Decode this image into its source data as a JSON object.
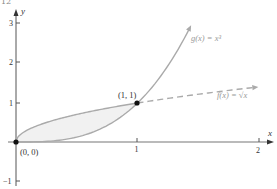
{
  "page_number": "12",
  "chart_data": {
    "type": "line",
    "title": "",
    "xlabel": "x",
    "ylabel": "y",
    "xlim": [
      0,
      2.1
    ],
    "ylim": [
      -1,
      3.2
    ],
    "x_ticks": [
      "1",
      "2"
    ],
    "y_ticks": [
      "-1",
      "1",
      "2",
      "3"
    ],
    "grid": false,
    "series": [
      {
        "name": "g(x) = x³",
        "label": "g(x) = x³",
        "style": "solid",
        "color": "#aaaaaa",
        "x": [
          0,
          0.25,
          0.5,
          0.75,
          1.0,
          1.2,
          1.35,
          1.45
        ],
        "values": [
          0,
          0.016,
          0.125,
          0.422,
          1.0,
          1.728,
          2.46,
          3.05
        ]
      },
      {
        "name": "f(x) = √x",
        "label": "f(x) = √x",
        "style": "solid on [0,1], dashed on [1,2]",
        "color": "#aaaaaa",
        "x": [
          0,
          0.1,
          0.25,
          0.5,
          0.75,
          1.0,
          1.5,
          2.0
        ],
        "values": [
          0,
          0.316,
          0.5,
          0.707,
          0.866,
          1.0,
          1.225,
          1.414
        ]
      }
    ],
    "shaded_region": {
      "between": [
        "f(x) = √x",
        "g(x) = x³"
      ],
      "x_from": 0,
      "x_to": 1,
      "color": "#f0f0f0"
    },
    "points": [
      {
        "label": "(0, 0)",
        "x": 0,
        "y": 0
      },
      {
        "label": "(1, 1)",
        "x": 1,
        "y": 1
      }
    ],
    "annotations": [
      "g(x) = x³",
      "f(x) = √x",
      "(0, 0)",
      "(1, 1)"
    ]
  },
  "labels": {
    "x_axis": "x",
    "y_axis": "y",
    "tick_x_1": "1",
    "tick_x_2": "2",
    "tick_y_neg1": "−1",
    "tick_y_1": "1",
    "tick_y_2": "2",
    "tick_y_3": "3",
    "point_origin": "(0, 0)",
    "point_one": "(1, 1)",
    "g_label": "g(x) = x³",
    "f_label": "f(x) = √x"
  }
}
